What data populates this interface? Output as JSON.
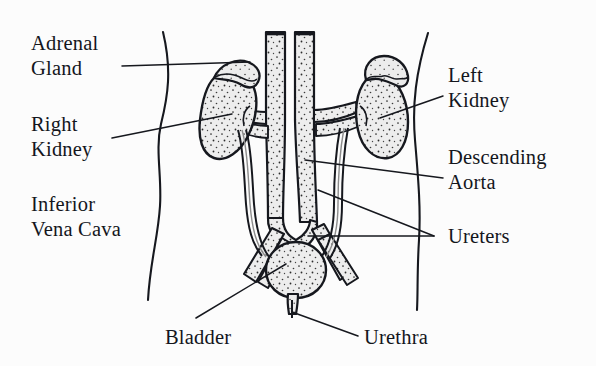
{
  "diagram": {
    "background_color": "#fcfcfc",
    "ink_color": "#14161c",
    "organ_fill_color": "#eeeeee",
    "stipple_color": "#2a2a2a"
  },
  "labels": {
    "adrenal_gland": "Adrenal\nGland",
    "right_kidney": "Right\nKidney",
    "inferior_vena_cava": "Inferior\nVena Cava",
    "left_kidney": "Left\nKidney",
    "descending_aorta": "Descending\nAorta",
    "ureters": "Ureters",
    "bladder": "Bladder",
    "urethra": "Urethra"
  },
  "structures": [
    {
      "name": "body-outline-left",
      "type": "contour"
    },
    {
      "name": "body-outline-right",
      "type": "contour"
    },
    {
      "name": "right-kidney",
      "type": "organ"
    },
    {
      "name": "left-kidney",
      "type": "organ"
    },
    {
      "name": "right-adrenal-gland",
      "type": "organ"
    },
    {
      "name": "left-adrenal-gland",
      "type": "organ"
    },
    {
      "name": "inferior-vena-cava",
      "type": "vessel"
    },
    {
      "name": "descending-aorta",
      "type": "vessel"
    },
    {
      "name": "renal-vessels",
      "type": "vessel"
    },
    {
      "name": "iliac-vessels",
      "type": "vessel"
    },
    {
      "name": "right-ureter",
      "type": "duct"
    },
    {
      "name": "left-ureter",
      "type": "duct"
    },
    {
      "name": "bladder",
      "type": "organ"
    },
    {
      "name": "urethra",
      "type": "duct"
    }
  ]
}
